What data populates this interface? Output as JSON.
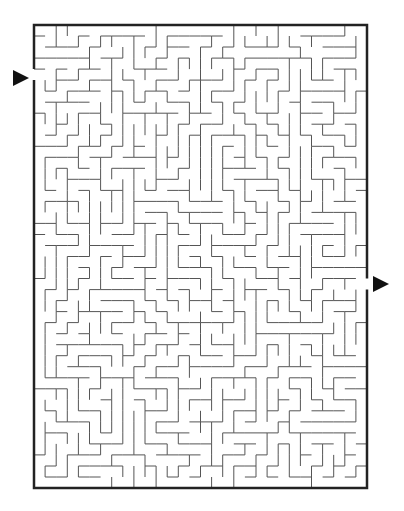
{
  "maze": {
    "cols": 30,
    "rows": 42,
    "left": 34,
    "top": 25,
    "width": 333,
    "height": 463,
    "wall_color": "#555555",
    "border_color": "#222222",
    "entrance": {
      "side": "left",
      "row": 4
    },
    "exit": {
      "side": "right",
      "row": 23
    },
    "seed": 7
  },
  "markers": {
    "start_arrow": {
      "label": "start",
      "x": 13,
      "y": 70
    },
    "end_arrow": {
      "label": "end",
      "x": 373,
      "y": 276
    }
  }
}
